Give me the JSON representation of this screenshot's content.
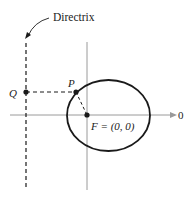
{
  "diagram": {
    "directrix_label": "Directrix",
    "point_q_label": "Q",
    "point_p_label": "P",
    "focus_label": "F = (0, 0)",
    "axis_end_label": "0",
    "colors": {
      "stroke": "#1a1a1a",
      "axis": "#9a9a9a"
    }
  }
}
